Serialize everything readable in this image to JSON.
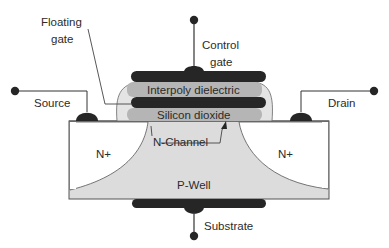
{
  "diagram": {
    "labels": {
      "floating_gate_line1": "Floating",
      "floating_gate_line2": "gate",
      "control_gate_line1": "Control",
      "control_gate_line2": "gate",
      "source": "Source",
      "drain": "Drain",
      "interpoly_dielectric": "Interpoly dielectric",
      "silicon_dioxide": "Silicon dioxide",
      "n_channel": "N-Channel",
      "n_plus_left": "N+",
      "n_plus_right": "N+",
      "p_well": "P-Well",
      "substrate": "Substrate"
    },
    "colors": {
      "conductor": "#2a2a2a",
      "dielectric": "#b8b8b8",
      "spacer": "#e2e2e2",
      "p_well": "#dcdcdc",
      "n_plus": "#ffffff",
      "outline": "#555555"
    }
  }
}
